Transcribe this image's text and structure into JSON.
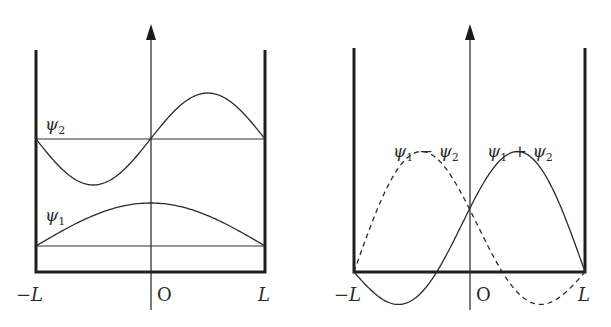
{
  "figure": {
    "left_panel": {
      "title": "Infinite square well: stationary states",
      "curves": [
        {
          "name": "psi2",
          "label": "ψ",
          "subscript": "2",
          "type": "sin(πx/L)",
          "style": "solid"
        },
        {
          "name": "psi1",
          "label": "ψ",
          "subscript": "1",
          "type": "cos(πx/2L)",
          "style": "solid"
        }
      ],
      "x_labels": {
        "left": "−L",
        "origin": "O",
        "right": "L"
      }
    },
    "right_panel": {
      "title": "Superpositions",
      "curves": [
        {
          "name": "psi1_minus_psi2",
          "label": "ψ₁ − ψ₂",
          "style": "dashed"
        },
        {
          "name": "psi1_plus_psi2",
          "label": "ψ₁ + ψ₂",
          "style": "solid"
        }
      ],
      "labels": {
        "minus": {
          "a": "ψ",
          "a_sub": "1",
          "op": " − ",
          "b": "ψ",
          "b_sub": "2"
        },
        "plus": {
          "a": "ψ",
          "a_sub": "1",
          "op": " + ",
          "b": "ψ",
          "b_sub": "2"
        }
      },
      "x_labels": {
        "left": "−L",
        "origin": "O",
        "right": "L"
      }
    },
    "colors": {
      "ink": "#2a2a2a",
      "background": "#ffffff"
    }
  }
}
